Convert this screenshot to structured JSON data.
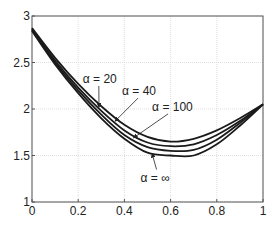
{
  "chart_data": {
    "type": "line",
    "title": "",
    "xlabel": "",
    "ylabel": "",
    "xlim": [
      0,
      1
    ],
    "ylim": [
      1,
      3
    ],
    "grid": true,
    "legend": "none (inline annotations with arrows)",
    "x_ticks": [
      "0",
      "0.2",
      "0.4",
      "0.6",
      "0.8",
      "1"
    ],
    "y_ticks": [
      "1",
      "1.5",
      "2",
      "2.5",
      "3"
    ],
    "x": [
      0,
      0.1,
      0.2,
      0.3,
      0.4,
      0.5,
      0.6,
      0.7,
      0.8,
      0.9,
      1.0
    ],
    "series": [
      {
        "name": "α = 20",
        "values": [
          2.87,
          2.55,
          2.27,
          2.03,
          1.83,
          1.7,
          1.65,
          1.68,
          1.77,
          1.9,
          2.05
        ]
      },
      {
        "name": "α = 40",
        "values": [
          2.86,
          2.52,
          2.23,
          1.98,
          1.77,
          1.64,
          1.6,
          1.62,
          1.72,
          1.87,
          2.05
        ]
      },
      {
        "name": "α = 100",
        "values": [
          2.85,
          2.5,
          2.2,
          1.94,
          1.72,
          1.59,
          1.55,
          1.56,
          1.67,
          1.85,
          2.05
        ]
      },
      {
        "name": "α = ∞",
        "values": [
          2.84,
          2.48,
          2.17,
          1.9,
          1.68,
          1.53,
          1.5,
          1.5,
          1.62,
          1.82,
          2.05
        ]
      }
    ],
    "annotations": [
      {
        "text": "α = 20",
        "label_pos": [
          0.22,
          2.28
        ],
        "arrow_to": [
          0.29,
          2.02
        ]
      },
      {
        "text": "α = 40",
        "label_pos": [
          0.39,
          2.15
        ],
        "arrow_to": [
          0.36,
          1.87
        ]
      },
      {
        "text": "α = 100",
        "label_pos": [
          0.52,
          1.98
        ],
        "arrow_to": [
          0.44,
          1.69
        ]
      },
      {
        "text": "α = ∞",
        "label_pos": [
          0.47,
          1.22
        ],
        "arrow_to": [
          0.52,
          1.52
        ]
      }
    ]
  }
}
